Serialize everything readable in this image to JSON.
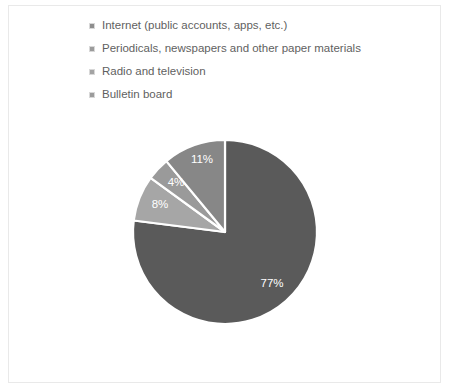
{
  "chart_data": {
    "type": "pie",
    "title": "",
    "categories": [
      "Internet (public accounts, apps, etc.)",
      "Periodicals, newspapers and other paper materials",
      "Radio and television",
      "Bulletin board"
    ],
    "values": [
      77,
      8,
      4,
      11
    ],
    "data_labels": [
      "77%",
      "8%",
      "4%",
      "11%"
    ],
    "colors": [
      "#5a5a5a",
      "#a6a6a6",
      "#9a9a9a",
      "#878787"
    ],
    "legend_position": "top",
    "grid": false,
    "start_angle_deg": 0,
    "direction": "clockwise",
    "slice_separator_color": "#ffffff"
  },
  "legend": {
    "items": [
      {
        "label": "Internet (public accounts, apps, etc.)",
        "color": "#8e8e8e"
      },
      {
        "label": "Periodicals, newspapers and other paper materials",
        "color": "#9b9b9b"
      },
      {
        "label": "Radio and television",
        "color": "#a3a3a3"
      },
      {
        "label": "Bulletin board",
        "color": "#9b9b9b"
      }
    ]
  },
  "slices": [
    {
      "name": "internet",
      "label": "77%",
      "color": "#5a5a5a",
      "value": 77,
      "label_x": 272,
      "label_y": 287
    },
    {
      "name": "periodicals",
      "label": "8%",
      "color": "#a6a6a6",
      "value": 8,
      "label_x": 160,
      "label_y": 208
    },
    {
      "name": "radio-television",
      "label": "4%",
      "color": "#9a9a9a",
      "value": 4,
      "label_x": 176,
      "label_y": 186
    },
    {
      "name": "bulletin-board",
      "label": "11%",
      "color": "#878787",
      "value": 11,
      "label_x": 202,
      "label_y": 163
    }
  ],
  "frame": {
    "border_color": "#e9e9e9",
    "background": "#ffffff"
  }
}
